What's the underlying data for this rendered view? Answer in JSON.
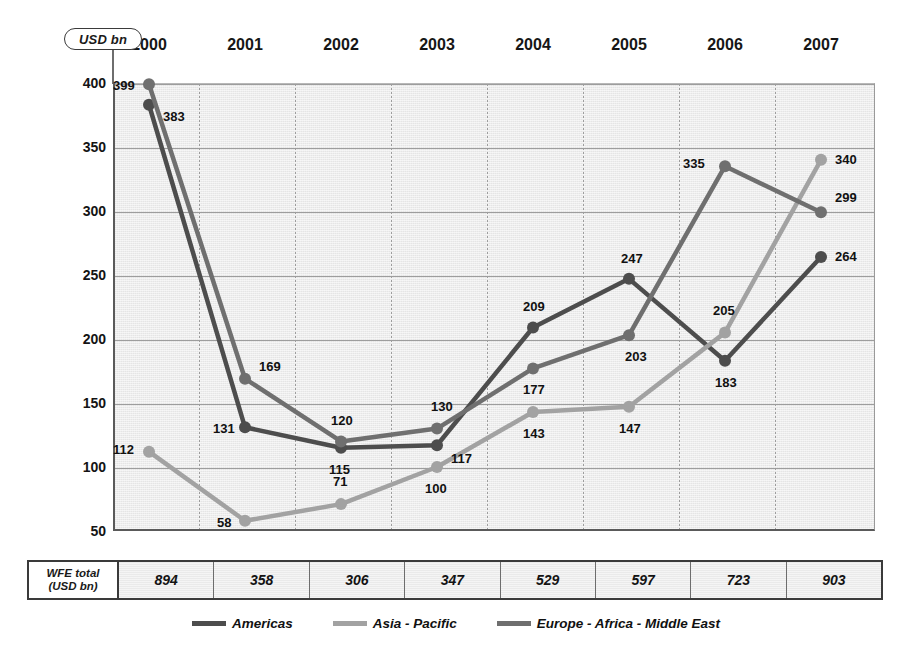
{
  "unit_badge": "USD bn",
  "y_axis": {
    "ticks": [
      400,
      350,
      300,
      250,
      200,
      150,
      100,
      50
    ],
    "min": 50,
    "max": 400
  },
  "years": [
    "2000",
    "2001",
    "2002",
    "2003",
    "2004",
    "2005",
    "2006",
    "2007"
  ],
  "wfe": {
    "header_line1": "WFE total",
    "header_line2": "(USD bn)",
    "values": [
      894,
      358,
      306,
      347,
      529,
      597,
      723,
      903
    ]
  },
  "legend": [
    {
      "label": "Americas",
      "color": "#4d4d4d"
    },
    {
      "label": "Asia - Pacific",
      "color": "#a2a2a2"
    },
    {
      "label": "Europe - Africa - Middle East",
      "color": "#6f6f6f"
    }
  ],
  "chart_data": {
    "type": "line",
    "title": "",
    "subtitle": "",
    "xlabel": "",
    "ylabel": "USD bn",
    "categories": [
      "2000",
      "2001",
      "2002",
      "2003",
      "2004",
      "2005",
      "2006",
      "2007"
    ],
    "ylim": [
      50,
      400
    ],
    "yticks": [
      50,
      100,
      150,
      200,
      250,
      300,
      350,
      400
    ],
    "grid": true,
    "legend_position": "bottom",
    "series": [
      {
        "name": "Americas",
        "color": "#4d4d4d",
        "values": [
          383,
          131,
          115,
          117,
          209,
          247,
          183,
          264
        ],
        "label_offsets": [
          {
            "dx": 14,
            "dy": 12
          },
          {
            "dx": -32,
            "dy": 2
          },
          {
            "dx": -12,
            "dy": 22
          },
          {
            "dx": 14,
            "dy": 14
          },
          {
            "dx": -10,
            "dy": -20
          },
          {
            "dx": -8,
            "dy": -20
          },
          {
            "dx": -10,
            "dy": 22
          },
          {
            "dx": 14,
            "dy": 0
          }
        ]
      },
      {
        "name": "Asia - Pacific",
        "color": "#a2a2a2",
        "values": [
          112,
          58,
          71,
          100,
          143,
          147,
          205,
          340
        ],
        "label_offsets": [
          {
            "dx": -36,
            "dy": -2
          },
          {
            "dx": -28,
            "dy": 2
          },
          {
            "dx": -8,
            "dy": -22
          },
          {
            "dx": -12,
            "dy": 22
          },
          {
            "dx": -10,
            "dy": 22
          },
          {
            "dx": -10,
            "dy": 22
          },
          {
            "dx": -12,
            "dy": -22
          },
          {
            "dx": 14,
            "dy": 0
          }
        ]
      },
      {
        "name": "Europe - Africa - Middle East",
        "color": "#6f6f6f",
        "values": [
          399,
          169,
          120,
          130,
          177,
          203,
          335,
          299
        ],
        "label_offsets": [
          {
            "dx": -36,
            "dy": 2
          },
          {
            "dx": 14,
            "dy": -12
          },
          {
            "dx": -10,
            "dy": -20
          },
          {
            "dx": -6,
            "dy": -22
          },
          {
            "dx": -10,
            "dy": 22
          },
          {
            "dx": -4,
            "dy": 22
          },
          {
            "dx": -42,
            "dy": -2
          },
          {
            "dx": 14,
            "dy": -14
          }
        ]
      }
    ]
  }
}
